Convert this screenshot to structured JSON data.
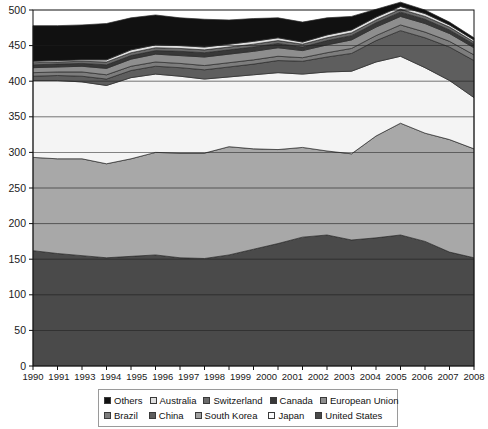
{
  "chart_data": {
    "type": "area",
    "stacked": true,
    "title": "",
    "xlabel": "",
    "ylabel": "",
    "ylim": [
      0,
      500
    ],
    "ytick_step": 50,
    "yticks": [
      0,
      50,
      100,
      150,
      200,
      250,
      300,
      350,
      400,
      450,
      500
    ],
    "grid": true,
    "legend_position": "bottom",
    "x": [
      1990,
      1991,
      1992,
      1993,
      1994,
      1995,
      1996,
      1997,
      1998,
      1999,
      2000,
      2001,
      2002,
      2003,
      2004,
      2005,
      2006,
      2007,
      2008
    ],
    "xtick_labels": [
      "1990",
      "1991",
      "1993",
      "1994",
      "1995",
      "1996",
      "1997",
      "1998",
      "1999",
      "2000",
      "2001",
      "2002",
      "2003",
      "2004",
      "2005",
      "2006",
      "2007",
      "2008"
    ],
    "series": [
      {
        "name": "United States",
        "color": "#4a4a4a",
        "values": [
          162,
          158,
          155,
          152,
          154,
          156,
          152,
          151,
          156,
          164,
          172,
          181,
          184,
          177,
          180,
          184,
          175,
          160,
          152
        ]
      },
      {
        "name": "Japan",
        "color": "#a8a8a8",
        "values": [
          131,
          133,
          136,
          132,
          137,
          144,
          147,
          148,
          152,
          141,
          132,
          126,
          118,
          121,
          143,
          157,
          152,
          158,
          153
        ]
      },
      {
        "name": "South Korea",
        "color": "#f4f4f4",
        "values": [
          108,
          110,
          108,
          110,
          114,
          110,
          108,
          104,
          98,
          104,
          108,
          103,
          111,
          116,
          104,
          94,
          92,
          83,
          72
        ]
      },
      {
        "name": "China",
        "color": "#5e5e5e",
        "values": [
          6,
          7,
          8,
          9,
          10,
          11,
          12,
          13,
          14,
          15,
          17,
          18,
          21,
          25,
          30,
          36,
          42,
          47,
          52
        ]
      },
      {
        "name": "Brazil",
        "color": "#7d7d7d",
        "values": [
          5,
          5,
          6,
          6,
          6,
          6,
          6,
          6,
          6,
          6,
          6,
          5,
          6,
          7,
          7,
          8,
          8,
          8,
          8
        ]
      },
      {
        "name": "European Union",
        "color": "#8e8e8e",
        "values": [
          7,
          7,
          8,
          9,
          10,
          11,
          11,
          12,
          12,
          12,
          12,
          10,
          11,
          12,
          12,
          12,
          12,
          11,
          10
        ]
      },
      {
        "name": "Canada",
        "color": "#383838",
        "values": [
          4,
          4,
          4,
          5,
          5,
          5,
          6,
          6,
          6,
          6,
          6,
          5,
          6,
          6,
          6,
          6,
          6,
          5,
          5
        ]
      },
      {
        "name": "Switzerland",
        "color": "#6b6b6b",
        "values": [
          3,
          3,
          3,
          4,
          4,
          4,
          4,
          4,
          4,
          4,
          4,
          4,
          4,
          4,
          4,
          4,
          4,
          4,
          3
        ]
      },
      {
        "name": "Australia",
        "color": "#e0e0e0",
        "values": [
          2,
          2,
          2,
          3,
          4,
          4,
          4,
          4,
          4,
          4,
          4,
          3,
          4,
          4,
          4,
          4,
          4,
          3,
          3
        ]
      },
      {
        "name": "Others",
        "color": "#111111",
        "values": [
          50,
          49,
          49,
          51,
          45,
          42,
          39,
          39,
          34,
          32,
          28,
          28,
          24,
          19,
          11,
          6,
          5,
          4,
          3
        ]
      }
    ],
    "totals": [
      478,
      478,
      479,
      479,
      479,
      483,
      481,
      479,
      481,
      481,
      481,
      443,
      485,
      487,
      485,
      487,
      476,
      440,
      380
    ]
  },
  "legend": {
    "row1": [
      {
        "label": "Others",
        "swatch": "#111111"
      },
      {
        "label": "Australia",
        "swatch": "#e0e0e0"
      },
      {
        "label": "Switzerland",
        "swatch": "#6b6b6b"
      },
      {
        "label": "Canada",
        "swatch": "#383838"
      },
      {
        "label": "European Union",
        "swatch": "#8e8e8e"
      }
    ],
    "row2": [
      {
        "label": "Brazil",
        "swatch": "#7d7d7d"
      },
      {
        "label": "China",
        "swatch": "#5e5e5e"
      },
      {
        "label": "South Korea",
        "swatch": "#a0a0a0"
      },
      {
        "label": "Japan",
        "swatch": "#fbfbfb"
      },
      {
        "label": "United States",
        "swatch": "#4a4a4a"
      }
    ]
  }
}
